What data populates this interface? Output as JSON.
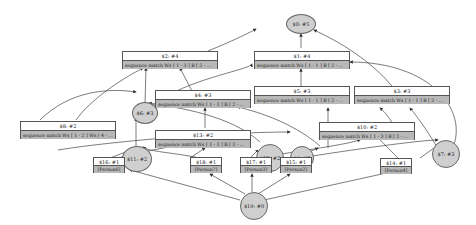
{
  "diagram": {
    "type": "state-graph",
    "colors": {
      "record_header": "#ffffff",
      "record_body": "#b8b8b8",
      "circle_fill": "#cfcfcf",
      "edge": "#333333"
    },
    "circles": [
      {
        "id": "n5",
        "label": "$0: #5"
      },
      {
        "id": "n6",
        "label": "$6: #3"
      },
      {
        "id": "n11",
        "label": "$11: #2"
      },
      {
        "id": "n12",
        "label": "$12: #2"
      },
      {
        "id": "n9",
        "label": "$9: #2"
      },
      {
        "id": "n7",
        "label": "$7: #3"
      },
      {
        "id": "n19",
        "label": "$19: #0"
      }
    ],
    "records": [
      {
        "id": "r2",
        "title": "$2: #4",
        "body": "sequence match Ws [ 1 - 3 ] B [ 2 - ..."
      },
      {
        "id": "r1",
        "title": "$1: #4",
        "body": "sequence match Ws [ 1 - 1 ] B [ 2 - ..."
      },
      {
        "id": "r3",
        "title": "$3: #3",
        "body": "sequence match Ws [ 1 - 1 ] B [ 2 - ..."
      },
      {
        "id": "r5",
        "title": "$5: #3",
        "body": "sequence match Ws [ 1 - 1 ] B [ 2 - ..."
      },
      {
        "id": "r4",
        "title": "$4: #3",
        "body": "sequence match Ws [ 1 - 3 ] B [ 2 - ..."
      },
      {
        "id": "r8",
        "title": "$8: #2",
        "body": "sequence match Ws [ 1 - 2 ] Ws [ 4 - ..."
      },
      {
        "id": "r13",
        "title": "$13: #2",
        "body": "sequence match Ws [ 1 - 3 ] B [ 3 - ..."
      },
      {
        "id": "r10",
        "title": "$10: #2",
        "body": "sequence match Ws [ 1 - 3 ] B [ 2 - ..."
      },
      {
        "id": "r16",
        "title": "$16: #1",
        "body": "[Person6]"
      },
      {
        "id": "r18",
        "title": "$18: #1",
        "body": "[Person7]"
      },
      {
        "id": "r17",
        "title": "$17: #1",
        "body": "[Person3]"
      },
      {
        "id": "r15",
        "title": "$15: #1",
        "body": "[Person2]"
      },
      {
        "id": "r14",
        "title": "$14: #1",
        "body": "[Person4]"
      }
    ]
  }
}
